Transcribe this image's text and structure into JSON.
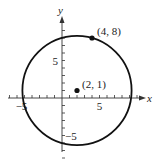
{
  "chart_data": {
    "type": "scatter",
    "title": "",
    "xlabel": "x",
    "ylabel": "y",
    "xlim": [
      -7,
      10
    ],
    "ylim": [
      -8,
      12
    ],
    "grid": false,
    "circle": {
      "center": [
        2,
        1
      ],
      "radius_squared": 53
    },
    "points": [
      {
        "x": 4,
        "y": 8,
        "label": "(4, 8)"
      },
      {
        "x": 2,
        "y": 1,
        "label": "(2, 1)"
      }
    ],
    "x_tick_labels": [
      {
        "value": -5,
        "label": "−5"
      },
      {
        "value": 5,
        "label": "5"
      }
    ],
    "y_tick_labels": [
      {
        "value": 5,
        "label": "5"
      },
      {
        "value": -5,
        "label": "−5"
      }
    ],
    "x_ticks": [
      -7,
      -6,
      -5,
      -4,
      -3,
      -2,
      -1,
      1,
      2,
      3,
      4,
      5,
      6,
      7,
      8,
      9,
      10
    ],
    "y_ticks": [
      -8,
      -7,
      -6,
      -5,
      -4,
      -3,
      -2,
      -1,
      1,
      2,
      3,
      4,
      5,
      6,
      7,
      8,
      9
    ]
  }
}
